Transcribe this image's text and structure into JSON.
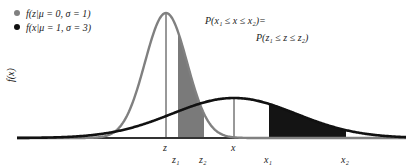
{
  "legend": {
    "items": [
      {
        "label": "f(z|μ = 0, σ = 1)",
        "color": "#808080"
      },
      {
        "label": "f(x|μ = 1, σ = 3)",
        "color": "#111111"
      }
    ]
  },
  "annotation": {
    "line1": "P(x₁ ≤ x ≤ x₂)=",
    "line2": "P(z₁ ≤ z ≤ z₂)"
  },
  "axis": {
    "ylabel": "f(x)",
    "ticks": {
      "z": "z",
      "x": "x",
      "z1": "z₁",
      "z2": "z₂",
      "x1": "x₁",
      "x2": "x₂"
    }
  },
  "colors": {
    "standard_curve": "#808080",
    "standard_fill": "#7a7a7a",
    "general_curve": "#111111",
    "general_fill": "#141414",
    "baseline": "#333333"
  },
  "chart_data": {
    "type": "area",
    "title": "",
    "series": [
      {
        "name": "f(z|μ=0, σ=1)",
        "mu": 0,
        "sigma": 1,
        "color": "#808080",
        "shaded_interval": [
          "z1",
          "z2"
        ]
      },
      {
        "name": "f(x|μ=1, σ=3)",
        "mu": 1,
        "sigma": 3,
        "color": "#111111",
        "shaded_interval": [
          "x1",
          "x2"
        ]
      }
    ],
    "xlabel": "",
    "ylabel": "f(x)",
    "geometry_px": {
      "baseline_y": 138,
      "x_start": 17,
      "x_end": 406,
      "standard": {
        "center": 166,
        "sigma_px": 21,
        "peak_y": 13,
        "shade_from": 178,
        "shade_to": 204
      },
      "general": {
        "center": 234,
        "sigma_px": 62,
        "peak_y": 98,
        "shade_from": 269,
        "shade_to": 346
      }
    }
  }
}
